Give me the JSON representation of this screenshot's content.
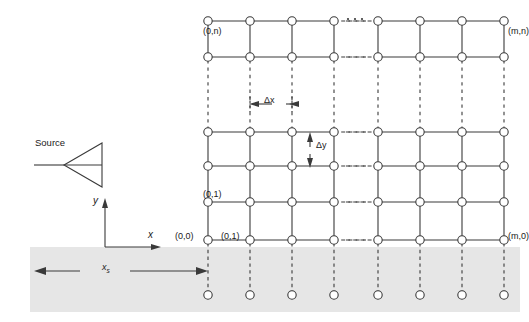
{
  "figure": {
    "type": "finite-difference-mesh-diagram",
    "background_color": "#ffffff",
    "line_color": "#3a3a3a",
    "node_fill": "#ffffff",
    "ground_fill": "#e6e6e6"
  },
  "source": {
    "label": "Source",
    "symbol": "triangle-left-amplifier-icon"
  },
  "axes": {
    "y_label": "y",
    "x_label": "x",
    "origin_x": 105,
    "origin_y": 247
  },
  "spacing": {
    "dx_label": "Δx",
    "dy_label": "Δy"
  },
  "dimension": {
    "xs_label": "x",
    "xs_sub": "s"
  },
  "node_labels": [
    {
      "text": "(0,n)",
      "x": 203,
      "y": 27,
      "align": "left"
    },
    {
      "text": "(m,n)",
      "x": 508,
      "y": 27,
      "align": "left"
    },
    {
      "text": "(0,1)",
      "x": 203,
      "y": 190,
      "align": "left"
    },
    {
      "text": "(0,0)",
      "x": 175,
      "y": 232,
      "align": "left"
    },
    {
      "text": "(0,1)",
      "x": 221,
      "y": 232,
      "align": "left"
    },
    {
      "text": "(m,0)",
      "x": 508,
      "y": 232,
      "align": "left"
    }
  ],
  "grid": {
    "columns_left": [
      208,
      250,
      292,
      334
    ],
    "columns_right": [
      378,
      420,
      462,
      504
    ],
    "rows_top": [
      21,
      57
    ],
    "rows_main": [
      132,
      166,
      202,
      240
    ],
    "ghost_row": 295,
    "ground_top": 247,
    "ground_bottom": 312,
    "ground_left": 30,
    "ground_right": 520
  },
  "ellipsis": {
    "horizontal_gap": "dashed",
    "vertical_gap": "dashed",
    "dot_rows": "···"
  }
}
